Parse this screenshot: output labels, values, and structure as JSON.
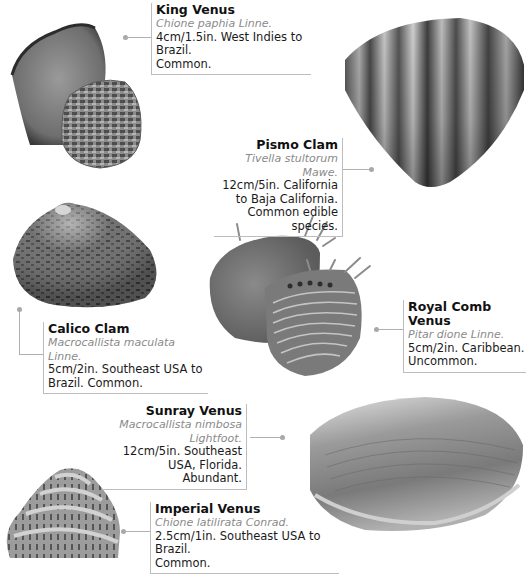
{
  "page": {
    "entries": [
      {
        "id": "king-venus",
        "name": "King Venus",
        "scientific": "Chione paphia Linne.",
        "desc_lines": [
          "4cm/1.5in. West Indies to Brazil.",
          "Common."
        ]
      },
      {
        "id": "pismo-clam",
        "name": "Pismo Clam",
        "scientific": "Tivella stultorum Mawe.",
        "desc_lines": [
          "12cm/5in. California to Baja California.",
          "Common edible species."
        ]
      },
      {
        "id": "calico-clam",
        "name": "Calico Clam",
        "scientific": "Macrocallista maculata Linne.",
        "desc_lines": [
          "5cm/2in. Southeast USA to",
          "Brazil. Common."
        ]
      },
      {
        "id": "royal-comb-venus",
        "name": "Royal Comb Venus",
        "scientific": "Pitar dione Linne.",
        "desc_lines": [
          "5cm/2in. Caribbean.",
          "Uncommon."
        ]
      },
      {
        "id": "sunray-venus",
        "name": "Sunray Venus",
        "scientific": "Macrocallista nimbosa Lightfoot.",
        "desc_lines": [
          "12cm/5in. Southeast",
          "USA, Florida.",
          "Abundant."
        ]
      },
      {
        "id": "imperial-venus",
        "name": "Imperial Venus",
        "scientific": "Chione latilirata Conrad.",
        "desc_lines": [
          "2.5cm/1in. Southeast USA to Brazil.",
          "Common."
        ]
      }
    ]
  }
}
